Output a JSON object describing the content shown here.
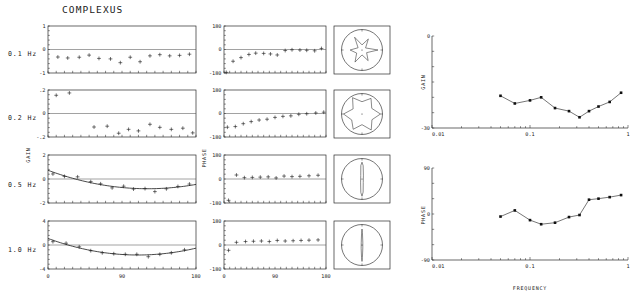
{
  "figure": {
    "title": "COMPLEXUS",
    "row_labels": [
      "0.1 Hz",
      "0.2 Hz",
      "0.5 Hz",
      "1.0 Hz"
    ],
    "gain_axis_name": "GAIN",
    "phase_axis_name": "PHASE",
    "frequency_axis_name": "FREQUENCY"
  },
  "chart_data": [
    {
      "type": "scatter",
      "name": "gain-0.1Hz",
      "title": "",
      "xlabel": "",
      "ylabel": "GAIN",
      "xlim": [
        0,
        180
      ],
      "ylim": [
        -1,
        1
      ],
      "xticks": [
        0,
        90,
        180
      ],
      "xticklabels": [
        "0",
        "90",
        "180"
      ],
      "yticks": [
        -1,
        0,
        1
      ],
      "yticklabels": [
        "-1",
        "0",
        "1"
      ],
      "grid": false,
      "marker": "plus",
      "x": [
        12,
        24,
        38,
        50,
        62,
        76,
        88,
        100,
        112,
        124,
        136,
        148,
        160,
        172
      ],
      "y": [
        -0.32,
        -0.36,
        -0.33,
        -0.24,
        -0.38,
        -0.4,
        -0.56,
        -0.33,
        -0.52,
        -0.27,
        -0.22,
        -0.27,
        -0.25,
        -0.2
      ]
    },
    {
      "type": "scatter",
      "name": "gain-0.2Hz",
      "title": "",
      "xlabel": "",
      "ylabel": "GAIN",
      "xlim": [
        0,
        180
      ],
      "ylim": [
        -0.2,
        0.2
      ],
      "xticks": [
        0,
        90,
        180
      ],
      "xticklabels": [
        "0",
        "90",
        "180"
      ],
      "yticks": [
        -0.2,
        0,
        0.2
      ],
      "yticklabels": [
        "-.2",
        "0",
        ".2"
      ],
      "grid": false,
      "marker": "plus",
      "x": [
        10,
        26,
        56,
        72,
        86,
        98,
        110,
        124,
        136,
        150,
        164,
        176
      ],
      "y": [
        0.155,
        0.175,
        -0.115,
        -0.108,
        -0.168,
        -0.135,
        -0.148,
        -0.092,
        -0.118,
        -0.135,
        -0.125,
        -0.165
      ]
    },
    {
      "type": "scatter",
      "name": "gain-0.5Hz",
      "title": "",
      "xlabel": "",
      "ylabel": "GAIN",
      "xlim": [
        0,
        180
      ],
      "ylim": [
        -2,
        2
      ],
      "xticks": [
        0,
        90,
        180
      ],
      "xticklabels": [
        "0",
        "90",
        "180"
      ],
      "yticks": [
        -2,
        0,
        2
      ],
      "yticklabels": [
        "-2",
        "0",
        "2"
      ],
      "grid": false,
      "marker": "plus",
      "has_fit_curve": true,
      "x": [
        6,
        20,
        36,
        52,
        64,
        78,
        92,
        104,
        118,
        130,
        144,
        158,
        172
      ],
      "y": [
        0.42,
        0.22,
        0.18,
        -0.22,
        -0.4,
        -0.74,
        -0.6,
        -0.84,
        -0.8,
        -1.05,
        -0.82,
        -0.62,
        -0.42
      ]
    },
    {
      "type": "scatter",
      "name": "gain-1.0Hz",
      "title": "",
      "xlabel": "",
      "ylabel": "GAIN",
      "xlim": [
        0,
        180
      ],
      "ylim": [
        -4,
        4
      ],
      "xticks": [
        0,
        90,
        180
      ],
      "xticklabels": [
        "0",
        "90",
        "180"
      ],
      "yticks": [
        -4,
        0,
        4
      ],
      "yticklabels": [
        "-4",
        "0",
        "4"
      ],
      "grid": false,
      "marker": "plus",
      "has_fit_curve": true,
      "x": [
        6,
        22,
        38,
        52,
        66,
        80,
        94,
        108,
        122,
        136,
        150,
        166
      ],
      "y": [
        0.55,
        0.3,
        -0.3,
        -0.95,
        -1.3,
        -1.45,
        -1.55,
        -1.55,
        -1.95,
        -1.55,
        -1.3,
        -0.8
      ]
    },
    {
      "type": "scatter",
      "name": "phase-0.1Hz",
      "title": "",
      "xlabel": "",
      "ylabel": "PHASE",
      "xlim": [
        0,
        180
      ],
      "ylim": [
        -180,
        180
      ],
      "xticks": [
        0,
        90,
        180
      ],
      "xticklabels": [
        "0",
        "90",
        "180"
      ],
      "yticks": [
        -180,
        0,
        180
      ],
      "yticklabels": [
        "-180",
        "0",
        "180"
      ],
      "grid": false,
      "marker": "plus",
      "x": [
        4,
        16,
        30,
        44,
        56,
        70,
        82,
        94,
        108,
        120,
        134,
        146,
        160,
        172
      ],
      "y": [
        -175,
        -90,
        -62,
        -38,
        -28,
        -30,
        -34,
        -42,
        -8,
        -2,
        -4,
        -6,
        -10,
        8
      ]
    },
    {
      "type": "scatter",
      "name": "phase-0.2Hz",
      "title": "",
      "xlabel": "",
      "ylabel": "PHASE",
      "xlim": [
        0,
        180
      ],
      "ylim": [
        -180,
        180
      ],
      "xticks": [
        0,
        90,
        180
      ],
      "xticklabels": [
        "0",
        "90",
        "180"
      ],
      "yticks": [
        -180,
        0,
        180
      ],
      "yticklabels": [
        "-180",
        "0",
        "180"
      ],
      "grid": false,
      "marker": "plus",
      "x": [
        6,
        20,
        34,
        48,
        62,
        76,
        90,
        104,
        118,
        132,
        146,
        162,
        176
      ],
      "y": [
        -105,
        -100,
        -78,
        -62,
        -50,
        -44,
        -30,
        -22,
        -18,
        -6,
        -2,
        4,
        10
      ]
    },
    {
      "type": "scatter",
      "name": "phase-0.5Hz",
      "title": "",
      "xlabel": "",
      "ylabel": "PHASE",
      "xlim": [
        0,
        180
      ],
      "ylim": [
        -180,
        180
      ],
      "xticks": [
        0,
        90,
        180
      ],
      "xticklabels": [
        "0",
        "90",
        "180"
      ],
      "yticks": [
        -180,
        0,
        180
      ],
      "yticklabels": [
        "-180",
        "0",
        "180"
      ],
      "grid": false,
      "marker": "plus",
      "x": [
        8,
        22,
        36,
        50,
        64,
        78,
        92,
        106,
        120,
        134,
        150,
        166
      ],
      "y": [
        -160,
        30,
        10,
        12,
        14,
        16,
        8,
        22,
        18,
        20,
        24,
        28
      ]
    },
    {
      "type": "scatter",
      "name": "phase-1.0Hz",
      "title": "",
      "xlabel": "",
      "ylabel": "PHASE",
      "xlim": [
        0,
        180
      ],
      "ylim": [
        -180,
        180
      ],
      "xticks": [
        0,
        90,
        180
      ],
      "xticklabels": [
        "0",
        "90",
        "180"
      ],
      "yticks": [
        -180,
        0,
        180
      ],
      "yticklabels": [
        "-180",
        "0",
        "180"
      ],
      "grid": false,
      "marker": "plus",
      "x": [
        8,
        22,
        38,
        52,
        66,
        80,
        94,
        108,
        122,
        136,
        150,
        166
      ],
      "y": [
        -40,
        20,
        26,
        28,
        30,
        26,
        34,
        30,
        32,
        34,
        36,
        38
      ]
    },
    {
      "type": "line",
      "name": "bode-gain",
      "title": "",
      "xlabel": "",
      "ylabel": "GAIN",
      "xscale": "log",
      "xlim": [
        0.01,
        1
      ],
      "ylim": [
        -30,
        0
      ],
      "xticks": [
        0.01,
        0.1,
        1
      ],
      "xticklabels": [
        "0.01",
        "0.1",
        "1"
      ],
      "yticks": [
        -30,
        0
      ],
      "yticklabels": [
        "-30",
        "0"
      ],
      "grid": false,
      "marker": "square",
      "x": [
        0.05,
        0.07,
        0.1,
        0.13,
        0.18,
        0.25,
        0.32,
        0.4,
        0.5,
        0.65,
        0.85
      ],
      "y": [
        -19.5,
        -22.0,
        -21.0,
        -20.0,
        -23.5,
        -24.5,
        -26.5,
        -24.5,
        -23.0,
        -21.5,
        -18.5
      ]
    },
    {
      "type": "line",
      "name": "bode-phase",
      "title": "",
      "xlabel": "FREQUENCY",
      "ylabel": "PHASE",
      "xscale": "log",
      "xlim": [
        0.01,
        1
      ],
      "ylim": [
        -90,
        90
      ],
      "xticks": [
        0.01,
        0.1,
        1
      ],
      "xticklabels": [
        "0.01",
        "0.1",
        "1"
      ],
      "yticks": [
        -90,
        0,
        90
      ],
      "yticklabels": [
        "-90",
        "0",
        "90"
      ],
      "grid": false,
      "marker": "square",
      "x": [
        0.05,
        0.07,
        0.1,
        0.13,
        0.18,
        0.25,
        0.32,
        0.4,
        0.5,
        0.65,
        0.85
      ],
      "y": [
        -5.0,
        7.0,
        -12.0,
        -20.0,
        -17.0,
        -6.0,
        -2.0,
        28.0,
        30.0,
        33.0,
        37.0
      ]
    },
    {
      "type": "polar",
      "name": "polar-0.1Hz",
      "title": "",
      "grid": false,
      "theta": [
        0,
        30,
        60,
        90,
        120,
        150,
        180,
        210,
        240,
        270,
        300,
        330
      ],
      "r": [
        0.78,
        0.2,
        0.62,
        0.25,
        0.72,
        0.22,
        0.58,
        0.3,
        0.68,
        0.24,
        0.6,
        0.26
      ]
    },
    {
      "type": "polar",
      "name": "polar-0.2Hz",
      "title": "",
      "grid": false,
      "theta": [
        0,
        30,
        60,
        90,
        120,
        150,
        180,
        210,
        240,
        270,
        300,
        330
      ],
      "r": [
        0.9,
        0.55,
        0.88,
        0.6,
        0.92,
        0.5,
        0.9,
        0.58,
        0.86,
        0.52,
        0.9,
        0.56
      ]
    },
    {
      "type": "polar",
      "name": "polar-0.5Hz",
      "title": "",
      "grid": false,
      "theta": [
        70,
        85,
        90,
        95,
        110,
        250,
        265,
        270,
        275,
        290
      ],
      "r": [
        0.2,
        0.65,
        0.82,
        0.66,
        0.18,
        0.2,
        0.66,
        0.84,
        0.64,
        0.18
      ]
    },
    {
      "type": "polar",
      "name": "polar-1.0Hz",
      "title": "",
      "grid": false,
      "theta": [
        75,
        88,
        90,
        92,
        105,
        255,
        268,
        270,
        272,
        285
      ],
      "r": [
        0.15,
        0.6,
        0.78,
        0.58,
        0.14,
        0.16,
        0.62,
        0.8,
        0.6,
        0.15
      ]
    }
  ]
}
